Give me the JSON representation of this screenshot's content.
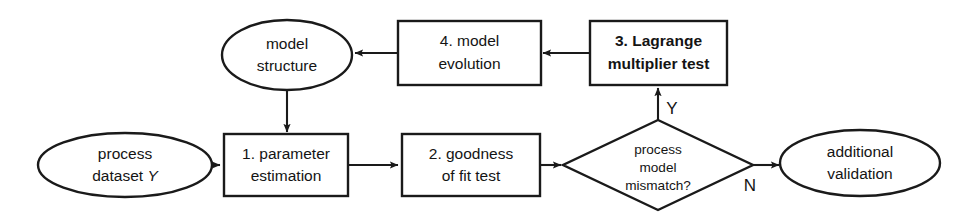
{
  "diagram": {
    "type": "flowchart",
    "title": "",
    "background_color": "#ffffff",
    "line_color": "#1a1a1a",
    "text_color": "#141414",
    "nodes": {
      "process_dataset": {
        "shape": "ellipse",
        "line1": "process",
        "line2_prefix": "dataset ",
        "line2_var": "Y"
      },
      "parameter_estimation": {
        "shape": "rectangle",
        "line1": "1. parameter",
        "line2": "estimation"
      },
      "goodness_of_fit": {
        "shape": "rectangle",
        "line1": "2. goodness",
        "line2": "of fit test"
      },
      "mismatch_decision": {
        "shape": "diamond",
        "line1": "process",
        "line2": "model",
        "line3": "mismatch?"
      },
      "additional_validation": {
        "shape": "ellipse",
        "line1": "additional",
        "line2": "validation"
      },
      "lagrange_test": {
        "shape": "rectangle",
        "bold": true,
        "line1": "3. Lagrange",
        "line2": "multiplier test"
      },
      "model_evolution": {
        "shape": "rectangle",
        "line1": "4. model",
        "line2": "evolution"
      },
      "model_structure": {
        "shape": "ellipse",
        "line1": "model",
        "line2": "structure"
      }
    },
    "edge_labels": {
      "yes": "Y",
      "no": "N"
    }
  }
}
